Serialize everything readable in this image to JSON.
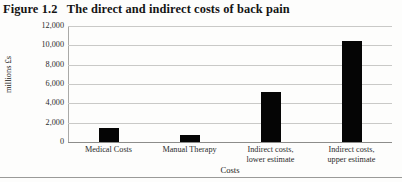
{
  "figure": {
    "title": "Figure 1.2   The direct and indirect costs of back pain"
  },
  "chart_data": {
    "type": "bar",
    "title": "The direct and indirect costs of back pain",
    "categories": [
      "Medical Costs",
      "Manual Therapy",
      "Indirect costs,\nlower estimate",
      "Indirect costs,\nupper estimate"
    ],
    "values": [
      1400,
      700,
      5200,
      10500
    ],
    "xlabel": "Costs",
    "ylabel": "millions £s",
    "ylim": [
      0,
      12000
    ],
    "ytick_step": 2000,
    "yticks": [
      0,
      2000,
      4000,
      6000,
      8000,
      10000,
      12000
    ],
    "ytick_labels": [
      "0",
      "2,000",
      "4,000",
      "6,000",
      "8,000",
      "10,000",
      "12,000"
    ],
    "grid": true,
    "legend": false,
    "bar_color": "#050505",
    "grid_color": "#c9c9c7",
    "axis_color": "#8d8d8b"
  }
}
